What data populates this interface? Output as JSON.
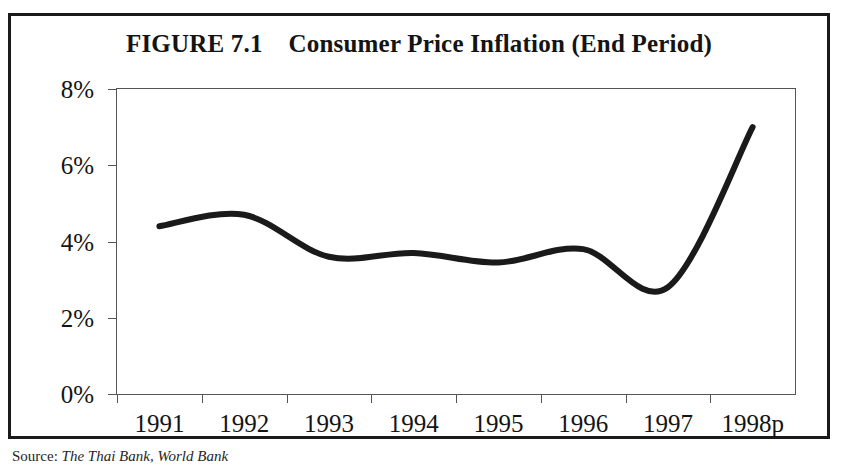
{
  "figure": {
    "title": "FIGURE 7.1    Consumer Price Inflation (End Period)",
    "title_prefix": "FIGURE 7.1",
    "title_text": "Consumer Price Inflation (End Period)",
    "source_label": "Source:",
    "source_body": "The Thai Bank, World Bank"
  },
  "chart_data": {
    "type": "line",
    "title": "FIGURE 7.1    Consumer Price Inflation (End Period)",
    "xlabel": "",
    "ylabel": "",
    "categories": [
      "1991",
      "1992",
      "1993",
      "1994",
      "1995",
      "1996",
      "1997",
      "1998p"
    ],
    "x_tick_labels": [
      "1991",
      "1992",
      "1993",
      "1994",
      "1995",
      "1996",
      "1997",
      "1998p"
    ],
    "y_tick_labels": [
      "0%",
      "2%",
      "4%",
      "6%",
      "8%"
    ],
    "y_tick_values": [
      0,
      2,
      4,
      6,
      8
    ],
    "ylim": [
      0,
      8
    ],
    "values": [
      4.4,
      4.7,
      3.6,
      3.7,
      3.45,
      3.8,
      2.8,
      7.0
    ],
    "series": [
      {
        "name": "Consumer Price Inflation (End Period)",
        "color": "#1a1a1a",
        "values": [
          4.4,
          4.7,
          3.6,
          3.7,
          3.45,
          3.8,
          2.8,
          7.0
        ]
      }
    ],
    "grid": false,
    "legend": false,
    "legend_position": "none",
    "smoothing": "spline",
    "line_width_px": 6,
    "annotations": []
  },
  "colors": {
    "frame": "#1a1a1a",
    "axis": "#555555",
    "line": "#1a1a1a",
    "text": "#141414",
    "background": "#ffffff"
  }
}
